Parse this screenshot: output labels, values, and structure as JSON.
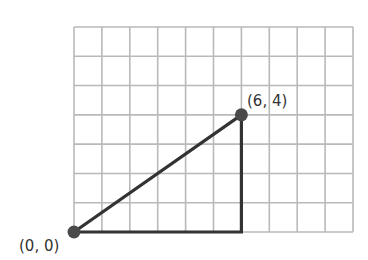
{
  "grid": {
    "columns": 10,
    "rows": 7,
    "left": 74,
    "top": 27,
    "right": 353,
    "bottom": 232,
    "line_color": "#b9b9b9"
  },
  "triangle": {
    "stroke_color": "#333333",
    "vertices": [
      {
        "x": 0,
        "y": 0
      },
      {
        "x": 6,
        "y": 4
      },
      {
        "x": 6,
        "y": 0
      }
    ]
  },
  "points": [
    {
      "x": 0,
      "y": 0,
      "label": "(0, 0)",
      "label_x": 19,
      "label_y": 251
    },
    {
      "x": 6,
      "y": 4,
      "label": "(6, 4)",
      "label_x": 247,
      "label_y": 106
    }
  ],
  "point_color": "#4a4a4a"
}
